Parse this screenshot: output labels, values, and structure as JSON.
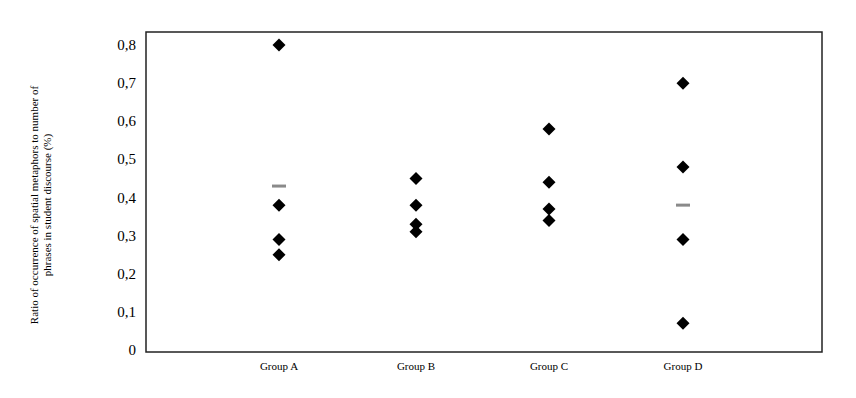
{
  "chart_data": {
    "type": "scatter",
    "title": "",
    "xlabel": "",
    "ylabel": "Ratio of occurrence of spatial metaphors to number of phrases in student discourse (%)",
    "ylabel_lines": [
      "Ratio of occurrence  of spatial metaphors to number of",
      "phrases in student discourse (%)"
    ],
    "categories": [
      "Group A",
      "Group B",
      "Group C",
      "Group D"
    ],
    "ylim": [
      0,
      0.8
    ],
    "yticks": [
      0,
      0.1,
      0.2,
      0.3,
      0.4,
      0.5,
      0.6,
      0.7,
      0.8
    ],
    "ytick_labels": [
      "0",
      "0,1",
      "0,2",
      "0,3",
      "0,4",
      "0,5",
      "0,6",
      "0,7",
      "0,8"
    ],
    "grid": false,
    "legend": null,
    "series": [
      {
        "name": "Individual values",
        "marker": "diamond",
        "color": "#000000",
        "points": [
          {
            "category": "Group A",
            "values": [
              0.8,
              0.38,
              0.29,
              0.25
            ]
          },
          {
            "category": "Group B",
            "values": [
              0.45,
              0.38,
              0.33,
              0.31
            ]
          },
          {
            "category": "Group C",
            "values": [
              0.58,
              0.44,
              0.37,
              0.34
            ]
          },
          {
            "category": "Group D",
            "values": [
              0.7,
              0.48,
              0.29,
              0.07
            ]
          }
        ]
      },
      {
        "name": "Mean",
        "marker": "dash",
        "color": "#8a8a8a",
        "points": [
          {
            "category": "Group A",
            "values": [
              0.43
            ]
          },
          {
            "category": "Group D",
            "values": [
              0.38
            ]
          }
        ]
      }
    ]
  }
}
